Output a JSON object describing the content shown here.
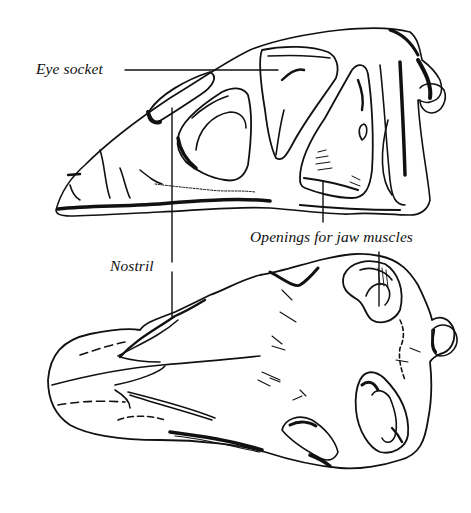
{
  "figure": {
    "views": [
      {
        "id": "side-view",
        "label": "Skull side view"
      },
      {
        "id": "top-view",
        "label": "Skull top view"
      }
    ]
  },
  "labels": {
    "eye_socket": "Eye socket",
    "nostril": "Nostril",
    "jaw_muscles": "Openings for jaw muscles"
  },
  "colors": {
    "ink": "#111111",
    "background": "#ffffff"
  }
}
